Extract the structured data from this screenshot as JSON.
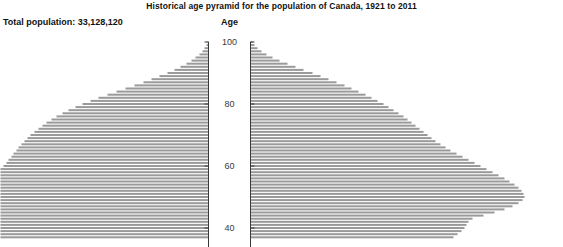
{
  "header": {
    "title": "Historical age pyramid for the population of Canada, 1921 to 2011",
    "total_population_label": "Total population: 33,128,120",
    "age_axis_label": "Age"
  },
  "style": {
    "bar_color": "#9a9a9a",
    "axis_color": "#3a3a3a",
    "background": "#ffffff",
    "text_color": "#111111"
  },
  "chart_data": {
    "type": "bar",
    "subtype": "population-pyramid",
    "title": "Historical age pyramid for the population of Canada, 1921 to 2011",
    "annotations": [
      "Total population: 33,128,120"
    ],
    "xlabel": "",
    "ylabel": "Age",
    "grid": false,
    "legend": false,
    "orientation": "horizontal",
    "ylim": [
      37,
      101
    ],
    "y_ticks": [
      40,
      60,
      80,
      100
    ],
    "y_tick_labels": [
      "40",
      "60",
      "80",
      "100"
    ],
    "note": "Mirrored pyramid: left series drawn right-to-left from the left axis, right series drawn left-to-right from the right axis. Ages below ~37 are cropped out of the visible frame; left bars at younger ages run off the left edge of the image.",
    "ages": [
      100,
      99,
      98,
      97,
      96,
      95,
      94,
      93,
      92,
      91,
      90,
      89,
      88,
      87,
      86,
      85,
      84,
      83,
      82,
      81,
      80,
      79,
      78,
      77,
      76,
      75,
      74,
      73,
      72,
      71,
      70,
      69,
      68,
      67,
      66,
      65,
      64,
      63,
      62,
      61,
      60,
      59,
      58,
      57,
      56,
      55,
      54,
      53,
      52,
      51,
      50,
      49,
      48,
      47,
      46,
      45,
      44,
      43,
      42,
      41,
      40,
      39,
      38,
      37
    ],
    "series": [
      {
        "name": "Left pyramid (clipped at image edge)",
        "direction": "left",
        "values": [
          1,
          2,
          4,
          6,
          9,
          13,
          17,
          22,
          28,
          34,
          41,
          49,
          57,
          65,
          74,
          83,
          92,
          101,
          110,
          118,
          126,
          133,
          140,
          146,
          152,
          157,
          162,
          166,
          170,
          174,
          178,
          181,
          184,
          187,
          190,
          192,
          195,
          197,
          200,
          202,
          205,
          208,
          208,
          208,
          208,
          208,
          208,
          208,
          208,
          208,
          208,
          208,
          208,
          208,
          208,
          208,
          208,
          208,
          208,
          208,
          208,
          208,
          208,
          208
        ]
      },
      {
        "name": "Right pyramid",
        "direction": "right",
        "values": [
          2,
          4,
          7,
          11,
          16,
          22,
          29,
          37,
          45,
          53,
          62,
          70,
          78,
          86,
          94,
          101,
          108,
          115,
          121,
          127,
          133,
          138,
          143,
          148,
          153,
          157,
          161,
          165,
          169,
          173,
          177,
          181,
          185,
          190,
          195,
          200,
          206,
          212,
          218,
          224,
          230,
          236,
          242,
          248,
          254,
          259,
          264,
          268,
          271,
          273,
          274,
          272,
          268,
          262,
          254,
          244,
          233,
          222,
          218,
          216,
          214,
          211,
          207,
          203
        ]
      }
    ]
  }
}
